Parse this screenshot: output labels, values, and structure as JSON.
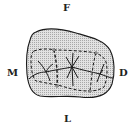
{
  "diagram": {
    "type": "dental-occlusal-view",
    "labels": {
      "top": "F",
      "left": "M",
      "right": "D",
      "bottom": "L"
    },
    "colors": {
      "fill": "#d4d4d4",
      "outline": "#1a1a1a",
      "text": "#222222"
    }
  }
}
